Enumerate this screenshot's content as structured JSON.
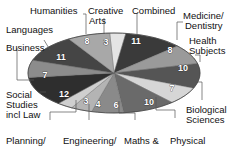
{
  "chart_data": {
    "type": "pie",
    "title": "",
    "categories": [
      "Creative Arts",
      "Combined",
      "Medicine/ Dentistry",
      "Health Subjects",
      "Biological Sciences",
      "Physical",
      "Maths &",
      "Engineering/",
      "Planning/",
      "Social Studies incl Law",
      "Business",
      "Languages",
      "Humanities"
    ],
    "values": [
      3,
      11,
      8,
      10,
      7,
      10,
      6,
      4,
      3,
      12,
      7,
      11,
      8
    ],
    "colors": [
      "#e4e4e4",
      "#3a3a3a",
      "#9a9a9a",
      "#555555",
      "#d6d6d6",
      "#6a6a6a",
      "#8a8a8a",
      "#b4b4b4",
      "#cfcfcf",
      "#2e2e2e",
      "#8c8c8c",
      "#454545",
      "#a8a8a8"
    ],
    "legend_position": "outside labels with leader lines"
  },
  "labels": {
    "creative_arts_1": "Creative",
    "creative_arts_2": "Arts",
    "combined": "Combined",
    "medicine_1": "Medicine/",
    "medicine_2": "Dentistry",
    "health_1": "Health",
    "health_2": "Subjects",
    "bio_1": "Biological",
    "bio_2": "Sciences",
    "physical": "Physical",
    "maths": "Maths &",
    "engineering": "Engineering/",
    "planning": "Planning/",
    "social_1": "Social",
    "social_2": "Studies",
    "social_3": "incl Law",
    "business": "Business",
    "languages": "Languages",
    "humanities": "Humanities"
  },
  "values_text": {
    "creative_arts": "3",
    "combined": "11",
    "medicine": "8",
    "health": "10",
    "bio": "7",
    "physical": "10",
    "maths": "6",
    "engineering": "4",
    "planning": "3",
    "social": "12",
    "business": "7",
    "languages": "11",
    "humanities": "8"
  }
}
